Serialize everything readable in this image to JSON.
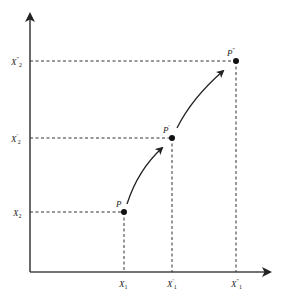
{
  "diagram": {
    "axes": {
      "x_axis": {
        "direction": "right",
        "arrow": true
      },
      "y_axis": {
        "direction": "up",
        "arrow": true
      }
    },
    "points": [
      {
        "id": "P",
        "label_base": "P",
        "label_prime": "",
        "x": 124,
        "y": 212
      },
      {
        "id": "P1",
        "label_base": "P",
        "label_prime": "′",
        "x": 172,
        "y": 138
      },
      {
        "id": "P2",
        "label_base": "P",
        "label_prime": "″",
        "x": 236,
        "y": 61
      }
    ],
    "x_ticks": [
      {
        "base": "X",
        "sub": "1",
        "prime": "",
        "x": 124
      },
      {
        "base": "X",
        "sub": "1",
        "prime": "′",
        "x": 172
      },
      {
        "base": "X",
        "sub": "1",
        "prime": "″",
        "x": 236
      }
    ],
    "y_ticks": [
      {
        "base": "X",
        "sub": "2",
        "prime": "″",
        "y": 61
      },
      {
        "base": "X",
        "sub": "2",
        "prime": "′",
        "y": 138
      },
      {
        "base": "X",
        "sub": "2",
        "prime": "",
        "y": 212
      }
    ],
    "arrows": [
      {
        "from": "P",
        "to": "P1"
      },
      {
        "from": "P1",
        "to": "P2"
      }
    ],
    "colors": {
      "ink": "#222222",
      "background": "#ffffff"
    }
  }
}
